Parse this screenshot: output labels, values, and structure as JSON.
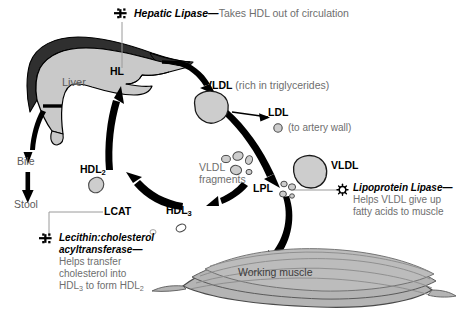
{
  "diagram": {
    "colors": {
      "liver_dark": "#2f2f2f",
      "liver_light": "#c9c9c9",
      "particle_fill": "#cdcdcd",
      "muscle_fill": "#b4b4b4",
      "arrow_black": "#000000",
      "text_gray": "#6e6e6e",
      "leader_gray": "#9a9a9a"
    }
  },
  "callouts": {
    "hepatic_lipase": {
      "marker": "enzyme-cross-icon",
      "head": "Hepatic Lipase—",
      "body": "Takes HDL out of circulation"
    },
    "lipoprotein_lipase": {
      "marker": "enzyme-star-icon",
      "head": "Lipoprotein Lipase—",
      "body_line1": "Helps VLDL give up",
      "body_line2": "fatty acids to muscle"
    },
    "lcat": {
      "marker": "enzyme-cross-icon",
      "head_line1": "Lecithin:cholesterol",
      "head_line2": "acyltransferase—",
      "body_line1": "Helps transfer",
      "body_line2": "cholesterol into",
      "body_line3_pre": "HDL",
      "body_line3_sub1": "3",
      "body_line3_mid": " to form HDL",
      "body_line3_sub2": "2"
    }
  },
  "labels": {
    "liver": "Liver",
    "hl": "HL",
    "bile": "Bile",
    "stool": "Stool",
    "vldl_top": "VLDL",
    "vldl_top_note": "(rich in triglycerides)",
    "ldl": "LDL",
    "ldl_note": "(to artery wall)",
    "vldl_right": "VLDL",
    "lpl": "LPL",
    "vldl_fragments_line1": "VLDL",
    "vldl_fragments_line2": "fragments",
    "hdl2_text": "HDL",
    "hdl2_sub": "2",
    "hdl3_text": "HDL",
    "hdl3_sub": "3",
    "lcat_abbrev": "LCAT",
    "working_muscle": "Working muscle"
  }
}
